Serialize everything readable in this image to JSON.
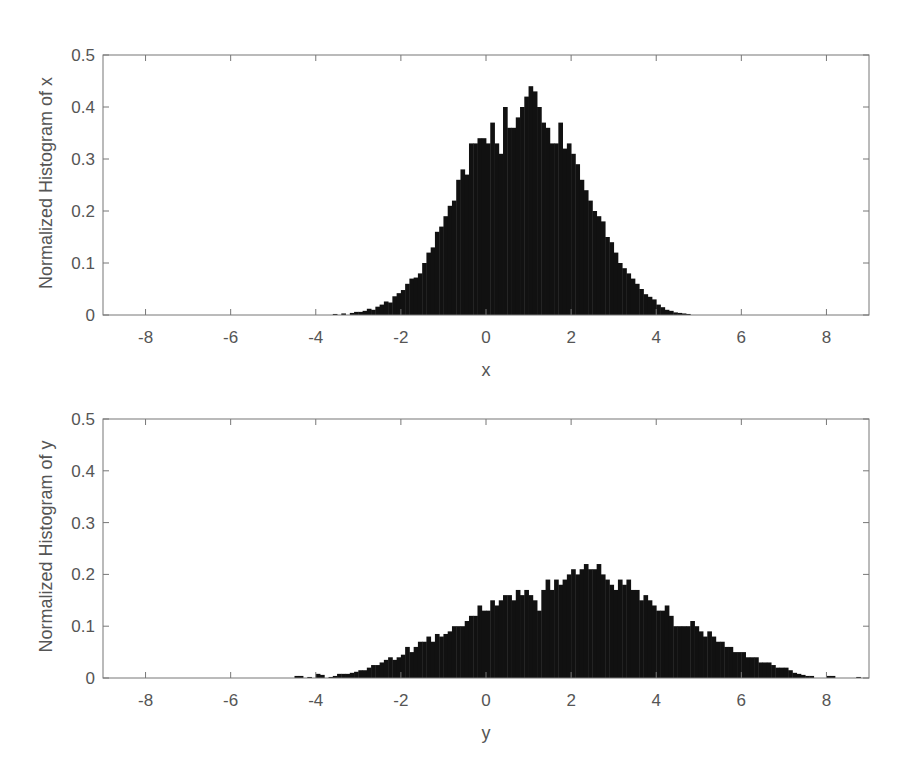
{
  "figure": {
    "panels": [
      {
        "xlabel": "x",
        "ylabel": "Normalized Histogram of x"
      },
      {
        "xlabel": "y",
        "ylabel": "Normalized Histogram of y"
      }
    ]
  },
  "chart_data": [
    {
      "type": "bar",
      "subtype": "histogram",
      "title": "",
      "xlabel": "x",
      "ylabel": "Normalized Histogram of x",
      "xlim": [
        -9,
        9
      ],
      "ylim": [
        0,
        0.5
      ],
      "xticks": [
        -8,
        -6,
        -4,
        -2,
        0,
        2,
        4,
        6,
        8
      ],
      "yticks": [
        0,
        0.1,
        0.2,
        0.3,
        0.4,
        0.5
      ],
      "grid": false,
      "bar_color": "#111111",
      "bin_width": 0.1,
      "bin_start": -3.6,
      "values": [
        0.002,
        0.0,
        0.003,
        0.0,
        0.004,
        0.006,
        0.006,
        0.008,
        0.012,
        0.01,
        0.016,
        0.02,
        0.026,
        0.024,
        0.036,
        0.042,
        0.048,
        0.06,
        0.07,
        0.072,
        0.08,
        0.1,
        0.12,
        0.13,
        0.16,
        0.17,
        0.19,
        0.21,
        0.22,
        0.26,
        0.28,
        0.27,
        0.33,
        0.33,
        0.34,
        0.34,
        0.33,
        0.37,
        0.33,
        0.31,
        0.4,
        0.36,
        0.36,
        0.38,
        0.4,
        0.42,
        0.44,
        0.43,
        0.4,
        0.37,
        0.36,
        0.33,
        0.33,
        0.37,
        0.32,
        0.33,
        0.31,
        0.29,
        0.26,
        0.24,
        0.22,
        0.2,
        0.19,
        0.18,
        0.15,
        0.14,
        0.12,
        0.1,
        0.09,
        0.08,
        0.07,
        0.06,
        0.05,
        0.04,
        0.035,
        0.03,
        0.02,
        0.015,
        0.01,
        0.008,
        0.005,
        0.004,
        0.003,
        0.002
      ]
    },
    {
      "type": "bar",
      "subtype": "histogram",
      "title": "",
      "xlabel": "y",
      "ylabel": "Normalized Histogram of y",
      "xlim": [
        -9,
        9
      ],
      "ylim": [
        0,
        0.5
      ],
      "xticks": [
        -8,
        -6,
        -4,
        -2,
        0,
        2,
        4,
        6,
        8
      ],
      "yticks": [
        0,
        0.1,
        0.2,
        0.3,
        0.4,
        0.5
      ],
      "grid": false,
      "bar_color": "#111111",
      "bin_width": 0.1,
      "bin_start": -4.5,
      "values": [
        0.004,
        0.004,
        0.0,
        0.002,
        0.0,
        0.008,
        0.006,
        0.0,
        0.002,
        0.004,
        0.008,
        0.008,
        0.008,
        0.01,
        0.012,
        0.015,
        0.015,
        0.02,
        0.025,
        0.025,
        0.03,
        0.035,
        0.04,
        0.035,
        0.04,
        0.045,
        0.06,
        0.05,
        0.06,
        0.07,
        0.07,
        0.08,
        0.07,
        0.085,
        0.08,
        0.085,
        0.09,
        0.1,
        0.1,
        0.1,
        0.11,
        0.12,
        0.12,
        0.14,
        0.13,
        0.13,
        0.15,
        0.14,
        0.15,
        0.16,
        0.16,
        0.15,
        0.17,
        0.16,
        0.17,
        0.16,
        0.15,
        0.13,
        0.17,
        0.19,
        0.17,
        0.19,
        0.18,
        0.19,
        0.2,
        0.21,
        0.2,
        0.21,
        0.22,
        0.21,
        0.21,
        0.22,
        0.2,
        0.19,
        0.18,
        0.17,
        0.19,
        0.18,
        0.19,
        0.17,
        0.17,
        0.15,
        0.16,
        0.15,
        0.14,
        0.13,
        0.13,
        0.14,
        0.12,
        0.1,
        0.1,
        0.1,
        0.1,
        0.11,
        0.1,
        0.09,
        0.08,
        0.09,
        0.08,
        0.07,
        0.07,
        0.06,
        0.06,
        0.05,
        0.05,
        0.05,
        0.04,
        0.04,
        0.04,
        0.03,
        0.03,
        0.03,
        0.025,
        0.02,
        0.02,
        0.02,
        0.015,
        0.01,
        0.008,
        0.006,
        0.004,
        0.004,
        0.0,
        0.0,
        0.0,
        0.004,
        0.004,
        0.0,
        0.0,
        0.0,
        0.0,
        0.0,
        0.002
      ]
    }
  ]
}
